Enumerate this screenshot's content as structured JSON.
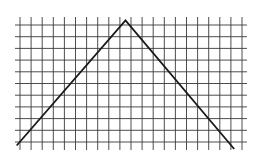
{
  "figure": {
    "grid": {
      "columns": 20,
      "rows": 10,
      "vertical_line_count": 21,
      "horizontal_line_count": 11,
      "line_color": "#3a3a3a"
    },
    "polyline": {
      "color": "#1a1a1a",
      "points_grid_units": [
        {
          "col": -0.3,
          "row": 10.3
        },
        {
          "col": 9.5,
          "row": -0.4
        },
        {
          "col": 19.3,
          "row": 10.6
        }
      ]
    }
  }
}
